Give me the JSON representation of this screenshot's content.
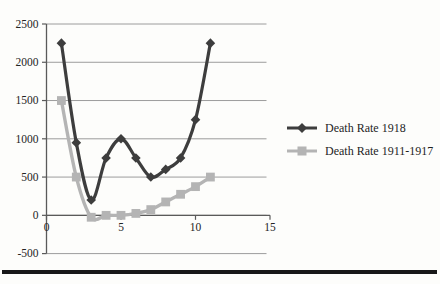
{
  "figure": {
    "background": "#fdfdfb",
    "bottom_rule_color": "#181818"
  },
  "chart_data": {
    "type": "line",
    "x": [
      1,
      2,
      3,
      4,
      5,
      6,
      7,
      8,
      9,
      10,
      11
    ],
    "series": [
      {
        "name": "Death Rate 1918",
        "marker": "diamond",
        "color": "#3d3d3d",
        "values": [
          2250,
          950,
          200,
          750,
          1000,
          750,
          500,
          600,
          750,
          1250,
          2250
        ]
      },
      {
        "name": "Death Rate 1911-1917",
        "marker": "square",
        "color": "#b4b4b4",
        "values": [
          1500,
          500,
          -25,
          0,
          0,
          25,
          75,
          175,
          275,
          375,
          500
        ]
      }
    ],
    "title": "",
    "xlabel": "",
    "ylabel": "",
    "xlim": [
      0,
      15
    ],
    "ylim": [
      -500,
      2500
    ],
    "xticks": [
      0,
      5,
      10,
      15
    ],
    "yticks": [
      -500,
      0,
      500,
      1000,
      1500,
      2000,
      2500
    ],
    "grid": "horizontal",
    "legend_position": "right"
  },
  "style": {
    "grid_color": "#9c9c9c",
    "axis_color": "#5a5a5a",
    "tick_label_color": "#242424"
  }
}
